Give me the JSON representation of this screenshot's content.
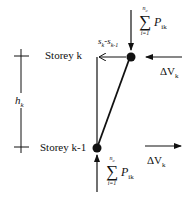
{
  "diagram": {
    "title": "",
    "labels": {
      "storey_upper": "Storey k",
      "storey_lower": "Storey k-1",
      "height": {
        "symbol": "h",
        "subscript": "k"
      },
      "drift": {
        "a": "s",
        "a_sub": "k",
        "sep": "-",
        "b": "s",
        "b_sub": "k-1"
      },
      "shear_top": {
        "symbol": "ΔV",
        "subscript": "k"
      },
      "shear_bottom": {
        "symbol": "ΔV",
        "subscript": "k"
      },
      "load_top": {
        "sigma": "∑",
        "upper": "n",
        "upper_sub": "c",
        "lower": "i=1",
        "term": "P",
        "term_sub": "ik"
      },
      "load_bottom": {
        "sigma": "∑",
        "upper": "n",
        "upper_sub": "c",
        "lower": "i=1",
        "term": "P",
        "term_sub": "ik"
      }
    },
    "nodes": [
      {
        "name": "node-storey-k",
        "x": 130,
        "y": 57
      },
      {
        "name": "node-storey-k-1",
        "x": 97,
        "y": 148
      }
    ],
    "colors": {
      "stroke": "#111111",
      "background": "#ffffff"
    }
  }
}
